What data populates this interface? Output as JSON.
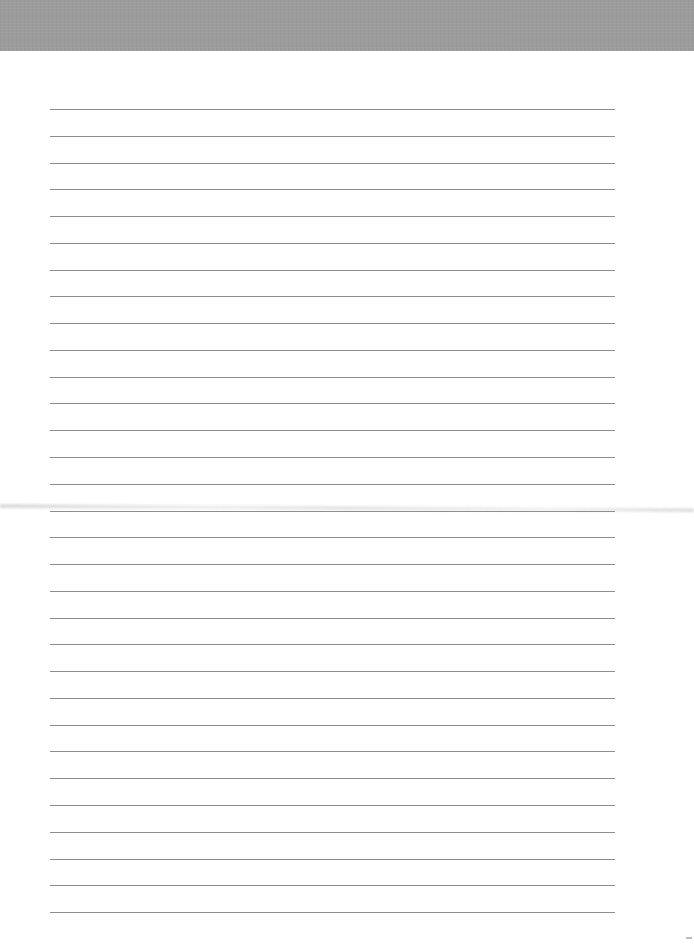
{
  "page": {
    "type": "ruled-paper",
    "header_band": {
      "color": "#9c9c9c"
    },
    "ruled_lines": {
      "count": 31,
      "first_y": 109,
      "spacing": 26.77,
      "left": 50,
      "width": 565,
      "color": "#8e8e8e"
    }
  }
}
